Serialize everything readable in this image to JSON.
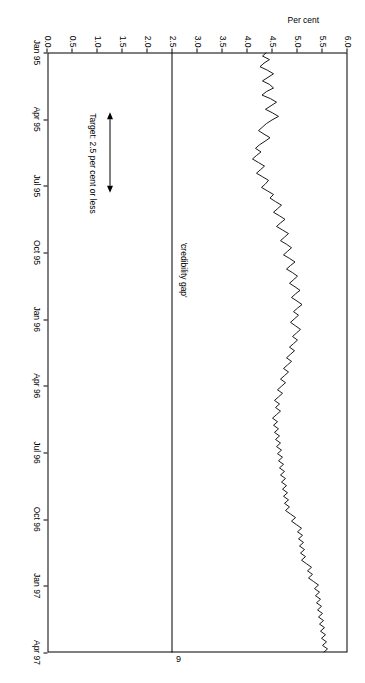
{
  "page": {
    "number": "9"
  },
  "chart_data": {
    "type": "line",
    "title": "",
    "xlabel": "",
    "ylabel": "Per cent",
    "ylim": [
      0.0,
      6.0
    ],
    "yticks": [
      "0.0",
      "0.5",
      "1.0",
      "1.5",
      "2.0",
      "2.5",
      "3.0",
      "3.5",
      "4.0",
      "4.5",
      "5.0",
      "5.5",
      "6.0"
    ],
    "xticks": [
      "Jan 95",
      "Apr 95",
      "Jul 95",
      "Oct 95",
      "Jan 96",
      "Apr 96",
      "Jul 96",
      "Oct 96",
      "Jan 97",
      "Apr 97"
    ],
    "grid": false,
    "legend": "none",
    "annotations": [
      {
        "name": "credibility-gap-label",
        "text": "'credibility gap'"
      },
      {
        "name": "target-label",
        "text": "Target: 2.5 per cent or less"
      }
    ],
    "target_line": {
      "value": 2.5,
      "style": "horizontal-line-full-width"
    },
    "arrow_band": {
      "from": "Apr 95",
      "to": "Jul 95",
      "at_value": 1.25,
      "style": "double-headed-arrow"
    },
    "series": [
      {
        "name": "implied forward inflation rate",
        "x": [
          "Jan 95",
          "Apr 95",
          "Jul 95",
          "Oct 95",
          "Jan 96",
          "Apr 96",
          "Jul 96",
          "Oct 96",
          "Jan 97",
          "Apr 97"
        ],
        "values": [
          4.35,
          4.45,
          4.2,
          4.55,
          4.8,
          4.85,
          4.6,
          4.75,
          5.2,
          5.55
        ],
        "points": [
          4.38,
          4.3,
          4.44,
          4.33,
          4.25,
          4.4,
          4.52,
          4.41,
          4.3,
          4.44,
          4.52,
          4.38,
          4.29,
          4.46,
          4.58,
          4.47,
          4.36,
          4.5,
          4.62,
          4.49,
          4.38,
          4.3,
          4.22,
          4.33,
          4.45,
          4.35,
          4.24,
          4.16,
          4.27,
          4.18,
          4.1,
          4.22,
          4.34,
          4.26,
          4.18,
          4.3,
          4.42,
          4.36,
          4.28,
          4.4,
          4.52,
          4.45,
          4.56,
          4.68,
          4.6,
          4.52,
          4.64,
          4.75,
          4.66,
          4.58,
          4.7,
          4.82,
          4.74,
          4.66,
          4.78,
          4.88,
          4.8,
          4.72,
          4.84,
          4.95,
          4.86,
          4.78,
          4.9,
          5.0,
          4.92,
          4.84,
          4.95,
          5.05,
          4.96,
          4.88,
          4.99,
          5.09,
          5.0,
          4.92,
          5.02,
          4.94,
          4.86,
          4.96,
          5.06,
          4.98,
          4.9,
          5.0,
          4.92,
          4.84,
          4.94,
          4.86,
          4.78,
          4.88,
          4.8,
          4.72,
          4.82,
          4.74,
          4.66,
          4.76,
          4.68,
          4.6,
          4.7,
          4.62,
          4.54,
          4.64,
          4.56,
          4.66,
          4.58,
          4.5,
          4.6,
          4.52,
          4.62,
          4.54,
          4.64,
          4.56,
          4.66,
          4.58,
          4.68,
          4.6,
          4.7,
          4.62,
          4.72,
          4.64,
          4.74,
          4.66,
          4.76,
          4.68,
          4.78,
          4.7,
          4.8,
          4.72,
          4.82,
          4.74,
          4.84,
          4.76,
          4.86,
          4.96,
          4.88,
          4.98,
          5.08,
          5.0,
          5.1,
          5.02,
          5.12,
          5.04,
          5.14,
          5.06,
          5.16,
          5.08,
          5.18,
          5.28,
          5.2,
          5.3,
          5.22,
          5.32,
          5.42,
          5.34,
          5.44,
          5.36,
          5.46,
          5.38,
          5.48,
          5.4,
          5.5,
          5.42,
          5.52,
          5.44,
          5.54,
          5.46,
          5.56,
          5.48,
          5.58,
          5.5,
          5.6,
          5.52
        ]
      }
    ]
  }
}
